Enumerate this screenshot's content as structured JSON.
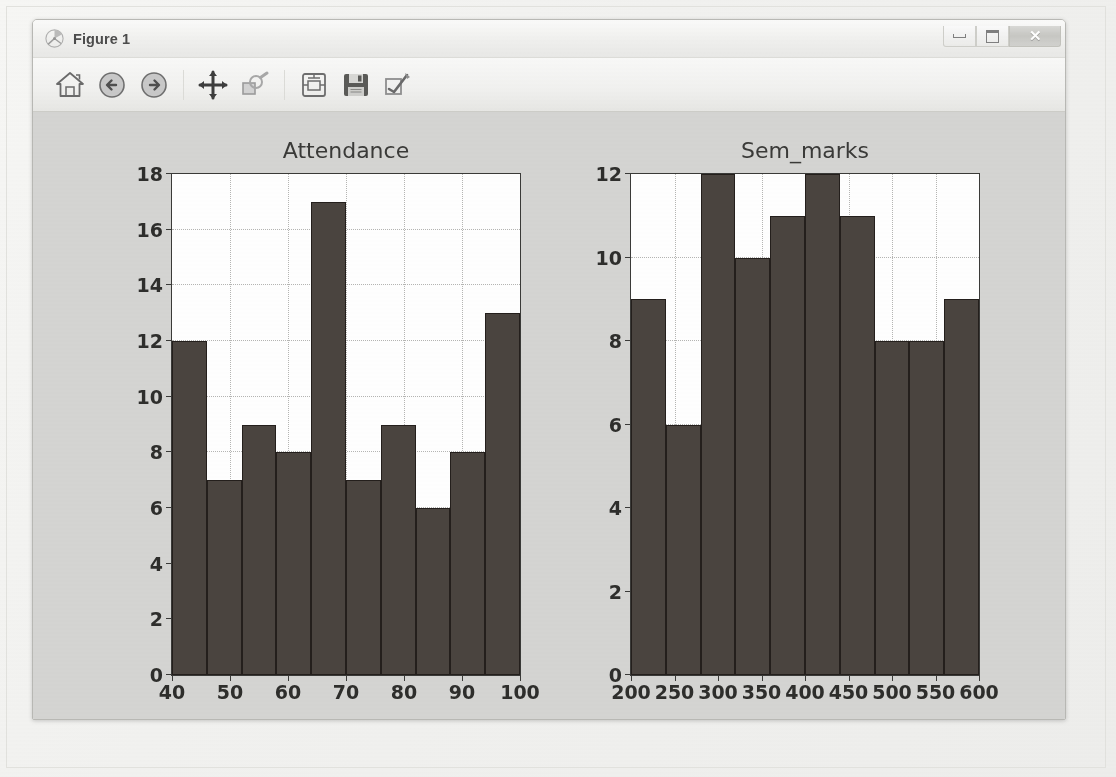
{
  "window": {
    "title": "Figure 1",
    "app_icon": "matplotlib-icon",
    "controls": {
      "minimize_label": "",
      "maximize_label": "",
      "close_label": "✕"
    }
  },
  "toolbar": {
    "buttons": [
      {
        "name": "home-button",
        "icon": "home-icon",
        "tooltip": "Reset original view"
      },
      {
        "name": "back-button",
        "icon": "back-arrow-icon",
        "tooltip": "Back to previous view"
      },
      {
        "name": "forward-button",
        "icon": "forward-arrow-icon",
        "tooltip": "Forward to next view"
      },
      {
        "name": "pan-button",
        "icon": "pan-move-icon",
        "tooltip": "Pan axes with left mouse, zoom with right"
      },
      {
        "name": "zoom-button",
        "icon": "zoom-rect-icon",
        "tooltip": "Zoom to rectangle"
      },
      {
        "name": "subplots-button",
        "icon": "configure-subplots-icon",
        "tooltip": "Configure subplots"
      },
      {
        "name": "save-button",
        "icon": "save-disk-icon",
        "tooltip": "Save the figure"
      },
      {
        "name": "edit-button",
        "icon": "edit-curves-icon",
        "tooltip": "Edit curves line and axes parameters"
      }
    ]
  },
  "chart_data": [
    {
      "type": "bar",
      "name": "attendance-histogram",
      "title": "Attendance",
      "xlabel": "",
      "ylabel": "",
      "xlim": [
        40,
        100
      ],
      "ylim": [
        0,
        18
      ],
      "grid": true,
      "bar_color": "#4a443f",
      "bar_edge_color": "#241f1c",
      "bin_edges": [
        40,
        46,
        52,
        58,
        64,
        70,
        76,
        82,
        88,
        94,
        100
      ],
      "categories": [
        "40-46",
        "46-52",
        "52-58",
        "58-64",
        "64-70",
        "70-76",
        "76-82",
        "82-88",
        "88-94",
        "94-100"
      ],
      "values": [
        12,
        7,
        9,
        8,
        17,
        7,
        9,
        6,
        8,
        13
      ],
      "xticks": [
        40,
        50,
        60,
        70,
        80,
        90,
        100
      ],
      "yticks": [
        0,
        2,
        4,
        6,
        8,
        10,
        12,
        14,
        16,
        18
      ]
    },
    {
      "type": "bar",
      "name": "sem-marks-histogram",
      "title": "Sem_marks",
      "xlabel": "",
      "ylabel": "",
      "xlim": [
        200,
        600
      ],
      "ylim": [
        0,
        12
      ],
      "grid": true,
      "bar_color": "#4a443f",
      "bar_edge_color": "#241f1c",
      "bin_edges": [
        200,
        240,
        280,
        320,
        360,
        400,
        440,
        480,
        520,
        560,
        600
      ],
      "categories": [
        "200-240",
        "240-280",
        "280-320",
        "320-360",
        "360-400",
        "400-440",
        "440-480",
        "480-520",
        "520-560",
        "560-600"
      ],
      "values": [
        9,
        6,
        12,
        10,
        11,
        12,
        11,
        8,
        8,
        9
      ],
      "xticks": [
        200,
        250,
        300,
        350,
        400,
        450,
        500,
        550,
        600
      ],
      "yticks": [
        0,
        2,
        4,
        6,
        8,
        10,
        12
      ]
    }
  ],
  "colors": {
    "figure_background": "#d5d5d3",
    "axes_background": "#ffffff",
    "bar_fill": "#4a443f",
    "axis_line": "#3a3a38",
    "gridline": "#b6b6b4",
    "window_chrome": "#efefed"
  }
}
